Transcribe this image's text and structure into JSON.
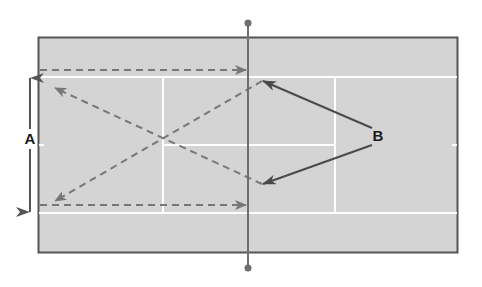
{
  "diagram": {
    "type": "tennis-court-drill",
    "orientation": "horizontal",
    "labels": {
      "a": "A",
      "b": "B"
    },
    "colors": {
      "background": "#ffffff",
      "court_fill": "#d4d4d4",
      "court_border": "#555555",
      "court_lines": "#ffffff",
      "net": "#6e6e6e",
      "dashed_paths": "#777777",
      "pointer_arrows": "#4a4a4a",
      "label_text": "#1a1a1a"
    },
    "elements": {
      "court": "rectangle with white singles sidelines, service lines and center service line",
      "net": "vertical line across middle with end posts",
      "range_arrow_A": "double-headed vertical arrow left of court spanning sideline to sideline",
      "dashed_paths": [
        "top sideline left-to-right toward net",
        "bottom sideline left-to-right toward net",
        "diagonal from top-right near net to bottom-left",
        "diagonal from bottom-right near net to top-left"
      ],
      "pointer_B": "two solid arrows from label B pointing to the two target spots near the net"
    }
  }
}
